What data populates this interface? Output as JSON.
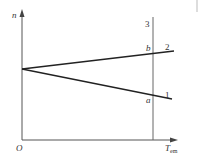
{
  "diagram": {
    "y_axis_label": "n",
    "x_axis_label_main": "T",
    "x_axis_label_sub": "em",
    "origin_label": "O",
    "lines": [
      {
        "id": "1",
        "label": "1",
        "description": "descending line from n-axis intercept"
      },
      {
        "id": "2",
        "label": "2",
        "description": "ascending line from n-axis intercept"
      },
      {
        "id": "3",
        "label": "3",
        "description": "vertical line at constant T_em"
      }
    ],
    "points": [
      {
        "label": "a",
        "description": "intersection of line 1 and line 3"
      },
      {
        "label": "b",
        "description": "intersection of line 2 and line 3"
      }
    ],
    "colors": {
      "stroke": "#333333",
      "axis": "#555555",
      "background": "#ffffff"
    }
  }
}
